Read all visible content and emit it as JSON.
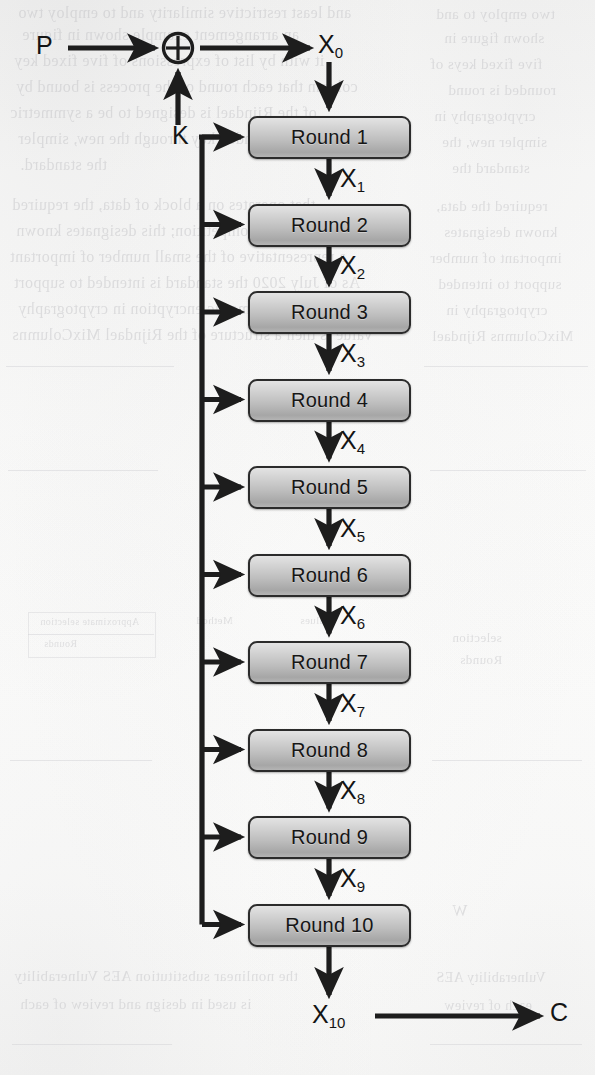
{
  "figure": {
    "kind": "block-cipher-round-diagram",
    "background_color": "#fbfbfa",
    "ink_color": "#2b2b2b",
    "box_fill_top": "#e3e3e3",
    "box_fill_bottom": "#a6a6a6"
  },
  "nodes": {
    "plaintext": "P",
    "xor": "⊕",
    "key": "K",
    "ciphertext": "C"
  },
  "state_labels": [
    {
      "base": "X",
      "sub": "0"
    },
    {
      "base": "X",
      "sub": "1"
    },
    {
      "base": "X",
      "sub": "2"
    },
    {
      "base": "X",
      "sub": "3"
    },
    {
      "base": "X",
      "sub": "4"
    },
    {
      "base": "X",
      "sub": "5"
    },
    {
      "base": "X",
      "sub": "6"
    },
    {
      "base": "X",
      "sub": "7"
    },
    {
      "base": "X",
      "sub": "8"
    },
    {
      "base": "X",
      "sub": "9"
    },
    {
      "base": "X",
      "sub": "10"
    }
  ],
  "rounds": [
    {
      "label": "Round 1"
    },
    {
      "label": "Round 2"
    },
    {
      "label": "Round 3"
    },
    {
      "label": "Round 4"
    },
    {
      "label": "Round 5"
    },
    {
      "label": "Round 6"
    },
    {
      "label": "Round 7"
    },
    {
      "label": "Round 8"
    },
    {
      "label": "Round 9"
    },
    {
      "label": "Round 10"
    }
  ],
  "geometry": {
    "box_left": 248,
    "box_width": 163,
    "box_height": 43,
    "first_box_top": 116,
    "box_pitch": 87.5,
    "data_axis_x": 329,
    "key_bus_x": 202,
    "xor_center_x": 178,
    "xor_center_y": 48,
    "xor_radius": 15
  },
  "bleed_through": {
    "note": "faint mirrored text from the reverse side of the scanned page",
    "lines": [
      "and least restrictive similarity and to employ two",
      "an arrangement example shown in figure",
      "it with by list of expressions of five fixed key",
      "column that each round of the process is bound by",
      "of the Rijndael is designed to be a symmetric",
      "the Rijndael expanded key through the new, simpler",
      "the standard.",
      "that operates on a block of data, the required",
      "in the AES competition; this designates known",
      "a representative of the small number of important",
      "As of July 2020 the standard is intended to support",
      "purpose symmetric encryption in cryptography",
      "value is then a structure of the Rijndael MixColumns",
      "Approximate selection",
      "Rounds",
      "Method",
      "Values",
      "W",
      "the nonlinear substitution AES Vulnerability",
      "is used in design and review of each"
    ]
  }
}
